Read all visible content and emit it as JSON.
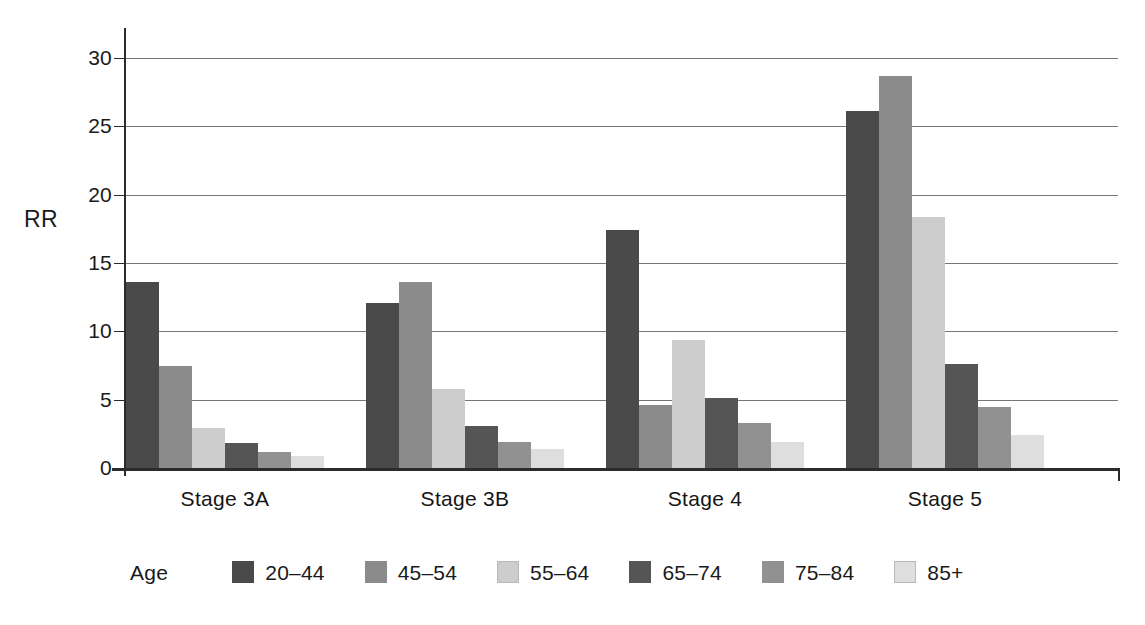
{
  "chart_data": {
    "type": "bar",
    "title": "",
    "xlabel": "",
    "ylabel": "RR",
    "ylim": [
      0,
      30
    ],
    "yticks": [
      0,
      5,
      10,
      15,
      20,
      25,
      30
    ],
    "ytick_labels": [
      "0",
      "5",
      "10",
      "15",
      "20",
      "25",
      "30"
    ],
    "grid": true,
    "legend_position": "bottom",
    "legend_title": "Age",
    "categories": [
      "Stage 3A",
      "Stage 3B",
      "Stage 4",
      "Stage 5"
    ],
    "series": [
      {
        "name": "20–44",
        "color": "#4a4a4a",
        "values": [
          13.6,
          12.1,
          17.4,
          26.1
        ]
      },
      {
        "name": "45–54",
        "color": "#8b8b8b",
        "values": [
          7.5,
          13.6,
          4.6,
          28.7
        ]
      },
      {
        "name": "55–64",
        "color": "#cdcdcd",
        "values": [
          2.9,
          5.8,
          9.4,
          18.4
        ]
      },
      {
        "name": "65–74",
        "color": "#555555",
        "values": [
          1.8,
          3.1,
          5.1,
          7.6
        ]
      },
      {
        "name": "75–84",
        "color": "#919191",
        "values": [
          1.2,
          1.9,
          3.3,
          4.5
        ]
      },
      {
        "name": "85+",
        "color": "#dedede",
        "values": [
          0.9,
          1.4,
          1.9,
          2.4
        ]
      }
    ]
  }
}
